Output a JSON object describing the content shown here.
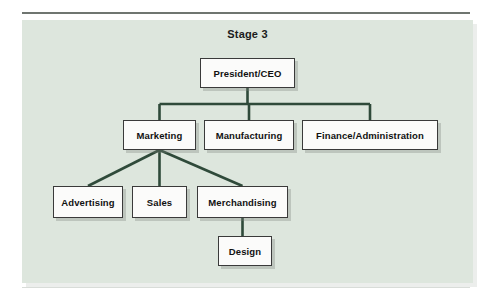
{
  "figure": {
    "title": "Stage 3",
    "background_color": "#dde6dd",
    "line_color": "#2f4a3a",
    "node_fill": "#fbfbfa",
    "node_border": "#3a3a3a"
  },
  "chart_data": {
    "type": "diagram",
    "subtype": "organizational-chart",
    "title": "Stage 3",
    "orientation": "top-down",
    "nodes": [
      {
        "id": "ceo",
        "label": "President/CEO",
        "level": 0,
        "x": 200,
        "y": 58,
        "w": 95,
        "h": 30
      },
      {
        "id": "marketing",
        "label": "Marketing",
        "level": 1,
        "x": 123,
        "y": 120,
        "w": 73,
        "h": 30
      },
      {
        "id": "manufacturing",
        "label": "Manufacturing",
        "level": 1,
        "x": 204,
        "y": 120,
        "w": 90,
        "h": 30
      },
      {
        "id": "finance",
        "label": "Finance/Administration",
        "level": 1,
        "x": 302,
        "y": 120,
        "w": 136,
        "h": 30
      },
      {
        "id": "advertising",
        "label": "Advertising",
        "level": 2,
        "x": 53,
        "y": 186,
        "w": 70,
        "h": 32
      },
      {
        "id": "sales",
        "label": "Sales",
        "level": 2,
        "x": 132,
        "y": 186,
        "w": 55,
        "h": 32
      },
      {
        "id": "merchandising",
        "label": "Merchandising",
        "level": 2,
        "x": 197,
        "y": 186,
        "w": 91,
        "h": 32
      },
      {
        "id": "design",
        "label": "Design",
        "level": 3,
        "x": 218,
        "y": 236,
        "w": 54,
        "h": 30
      }
    ],
    "edges": [
      {
        "from": "ceo",
        "to": "marketing",
        "style": "orthogonal"
      },
      {
        "from": "ceo",
        "to": "manufacturing",
        "style": "orthogonal"
      },
      {
        "from": "ceo",
        "to": "finance",
        "style": "orthogonal"
      },
      {
        "from": "marketing",
        "to": "advertising",
        "style": "diagonal"
      },
      {
        "from": "marketing",
        "to": "sales",
        "style": "straight"
      },
      {
        "from": "marketing",
        "to": "merchandising",
        "style": "diagonal"
      },
      {
        "from": "merchandising",
        "to": "design",
        "style": "straight"
      }
    ]
  }
}
